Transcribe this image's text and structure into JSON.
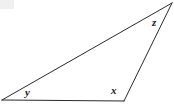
{
  "figure": {
    "name": "triangle-angle-diagram",
    "type": "geometry-diagram",
    "background_color": "#ffffff",
    "stroke_color": "#2b2b2b",
    "stroke_width": 1,
    "canvas": {
      "width": 174,
      "height": 106
    },
    "shape": {
      "kind": "triangle",
      "vertices": [
        {
          "id": "apex",
          "x": 172,
          "y": 3,
          "angle_label": "z"
        },
        {
          "id": "bottom-right",
          "x": 124,
          "y": 101,
          "angle_label": "x"
        },
        {
          "id": "bottom-left",
          "x": 2,
          "y": 100,
          "angle_label": "y"
        }
      ],
      "edges": [
        {
          "id": "base",
          "from": "bottom-left",
          "to": "bottom-right"
        },
        {
          "id": "right-side",
          "from": "bottom-right",
          "to": "apex"
        },
        {
          "id": "hypotenuse",
          "from": "apex",
          "to": "bottom-left"
        }
      ]
    },
    "labels": [
      {
        "id": "angle-z",
        "text": "z",
        "x": 156,
        "y": 23
      },
      {
        "id": "angle-x",
        "text": "x",
        "x": 115,
        "y": 91
      },
      {
        "id": "angle-y",
        "text": "y",
        "x": 29,
        "y": 93
      }
    ]
  }
}
